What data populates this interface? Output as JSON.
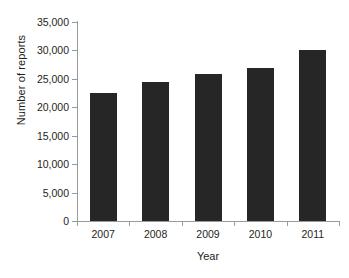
{
  "chart_data": {
    "type": "bar",
    "title": "",
    "xlabel": "Year",
    "ylabel": "Number of reports",
    "categories": [
      "2007",
      "2008",
      "2009",
      "2010",
      "2011"
    ],
    "values": [
      22500,
      24400,
      25800,
      27000,
      30000
    ],
    "ylim": [
      0,
      35000
    ],
    "ytick_values": [
      0,
      5000,
      10000,
      15000,
      20000,
      25000,
      30000,
      35000
    ],
    "ytick_labels": [
      "0",
      "5,000",
      "10,000",
      "15,000",
      "20,000",
      "25,000",
      "30,000",
      "35,000"
    ],
    "grid": false,
    "legend": null,
    "bar_color": "#262626",
    "axis_color": "#9a9a9a",
    "background": "#ffffff"
  }
}
